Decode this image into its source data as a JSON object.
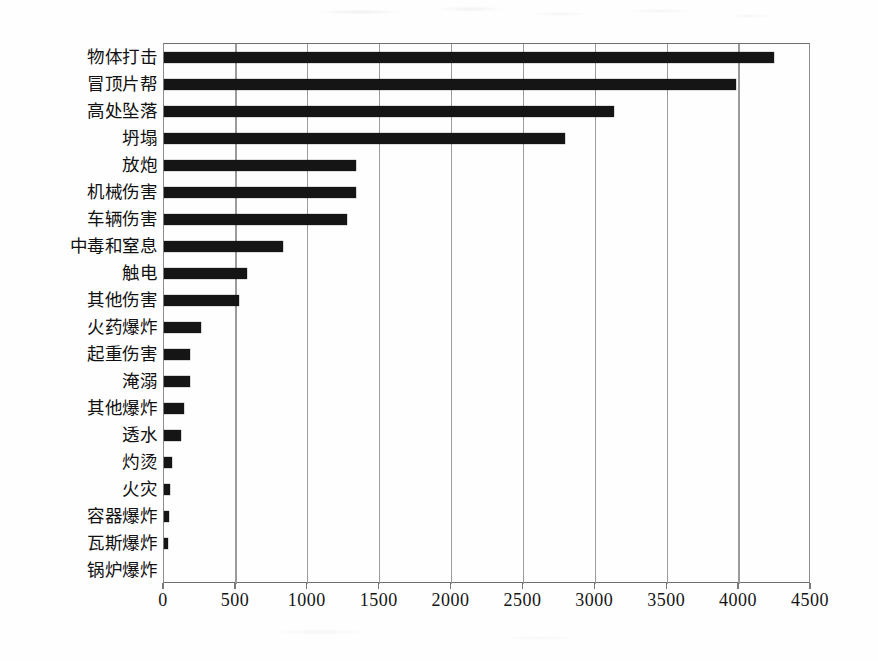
{
  "chart_data": {
    "type": "bar",
    "orientation": "horizontal",
    "title": "",
    "subtitle": "",
    "xlabel": "",
    "ylabel": "",
    "xlim": [
      0,
      4500
    ],
    "xticks": [
      0,
      500,
      1000,
      1500,
      2000,
      2500,
      3000,
      3500,
      4000,
      4500
    ],
    "xtick_labels": [
      "0",
      "500",
      "1000",
      "1500",
      "2000",
      "2500",
      "3000",
      "3500",
      "4000",
      "4500"
    ],
    "grid": "vertical",
    "legend": "none",
    "bar_color": "#151515",
    "grid_color": "#9b9b9b",
    "categories": [
      "物体打击",
      "冒顶片帮",
      "高处坠落",
      "坍塌",
      "放炮",
      "机械伤害",
      "车辆伤害",
      "中毒和窒息",
      "触电",
      "其他伤害",
      "火药爆炸",
      "起重伤害",
      "淹溺",
      "其他爆炸",
      "透水",
      "灼烫",
      "火灾",
      "容器爆炸",
      "瓦斯爆炸",
      "锅炉爆炸"
    ],
    "values": [
      4245,
      3980,
      3130,
      2790,
      1335,
      1335,
      1270,
      830,
      580,
      520,
      260,
      180,
      180,
      140,
      115,
      55,
      45,
      35,
      25,
      0
    ]
  },
  "layout": {
    "plot_left": 163,
    "plot_top": 43,
    "plot_width": 647,
    "plot_height": 540,
    "px_per_unit": 0.14378,
    "bar_thickness": 11,
    "bar_pitch": 28.42
  }
}
